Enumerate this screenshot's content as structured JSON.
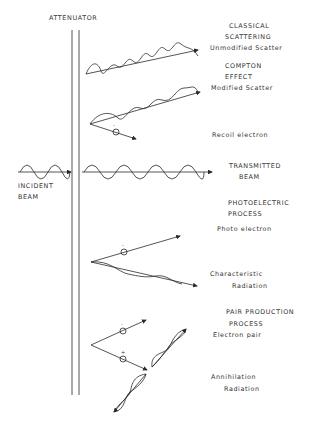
{
  "diagram": {
    "attenuator_label": "ATTENUATOR",
    "incident": {
      "line1": "INCIDENT",
      "line2": "BEAM"
    },
    "classical": {
      "line1": "CLASSICAL",
      "line2": "SCATTERING",
      "line3": "Unmodified Scatter"
    },
    "compton": {
      "line1": "COMPTON",
      "line2": "EFFECT",
      "line3": "Modified Scatter",
      "recoil": "Recoil electron",
      "electron_sign": "-"
    },
    "transmitted": {
      "line1": "TRANSMITTED",
      "line2": "BEAM"
    },
    "photoelectric": {
      "line1": "PHOTOELECTRIC",
      "line2": "PROCESS",
      "photo_electron": "Photo electron",
      "char1": "Characteristic",
      "char2": "Radiation",
      "electron_sign": "-"
    },
    "pair": {
      "line1": "PAIR PRODUCTION",
      "line2": "PROCESS",
      "electron_pair": "Electron pair",
      "ann1": "Annihilation",
      "ann2": "Radiation",
      "neg_sign": "-",
      "pos_sign": "+"
    },
    "colors": {
      "ink": "#2a2a2a",
      "background": "#ffffff"
    }
  }
}
